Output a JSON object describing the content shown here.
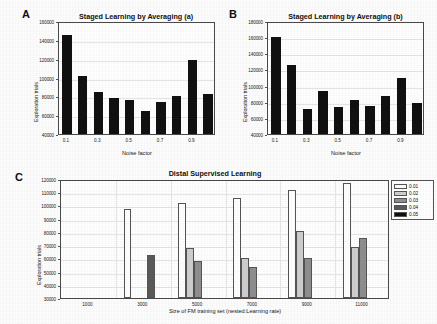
{
  "figure": {
    "background": "#fdfdfd",
    "bar_color_dark": "#111111"
  },
  "panels": [
    {
      "letter": "A",
      "title": "Staged Learning by Averaging (a)"
    },
    {
      "letter": "B",
      "title": "Staged Learning by Averaging (b)"
    },
    {
      "letter": "C",
      "title": "Distal Supervised Learning"
    }
  ],
  "chart_data": [
    {
      "type": "bar",
      "panel": "A",
      "title": "Staged Learning by Averaging (a)",
      "xlabel": "Noise factor",
      "ylabel": "Exploration trials",
      "ylim": [
        40000,
        160000
      ],
      "yticks": [
        40000,
        60000,
        80000,
        100000,
        120000,
        140000,
        160000
      ],
      "ytick_labels": [
        "40000",
        "60000",
        "80000",
        "100000",
        "120000",
        "140000",
        "160000"
      ],
      "categories": [
        "0.1",
        "0.2",
        "0.3",
        "0.4",
        "0.5",
        "0.6",
        "0.7",
        "0.8",
        "0.9",
        "1.0"
      ],
      "xtick_labels": [
        "0.1",
        "0.3",
        "0.5",
        "0.7",
        "0.9"
      ],
      "xtick_positions": [
        0,
        2,
        4,
        6,
        8
      ],
      "values": [
        145500,
        101500,
        84500,
        78500,
        76500,
        64800,
        74000,
        80800,
        118300,
        83000
      ],
      "grid": true,
      "legend": null
    },
    {
      "type": "bar",
      "panel": "B",
      "title": "Staged Learning by Averaging (b)",
      "xlabel": "Noise factor",
      "ylabel": "Exploration trials",
      "ylim": [
        40000,
        180000
      ],
      "yticks": [
        40000,
        60000,
        80000,
        100000,
        120000,
        140000,
        160000,
        180000
      ],
      "ytick_labels": [
        "40000",
        "60000",
        "80000",
        "100000",
        "120000",
        "140000",
        "160000",
        "180000"
      ],
      "categories": [
        "0.1",
        "0.2",
        "0.3",
        "0.4",
        "0.5",
        "0.6",
        "0.7",
        "0.8",
        "0.9",
        "1.0"
      ],
      "xtick_labels": [
        "0.1",
        "0.3",
        "0.5",
        "0.7",
        "0.9"
      ],
      "xtick_positions": [
        0,
        2,
        4,
        6,
        8
      ],
      "values": [
        160000,
        126000,
        70500,
        93500,
        73500,
        82200,
        74500,
        86500,
        110000,
        78500
      ],
      "grid": true,
      "legend": null
    },
    {
      "type": "bar",
      "panel": "C",
      "title": "Distal Supervised Learning",
      "xlabel": "Size of FM training set (nested:Learning rate)",
      "ylabel": "Exploration trials",
      "ylim": [
        30000,
        120000
      ],
      "yticks": [
        30000,
        40000,
        50000,
        60000,
        70000,
        80000,
        90000,
        100000,
        110000,
        120000
      ],
      "ytick_labels": [
        "30000",
        "40000",
        "50000",
        "60000",
        "70000",
        "80000",
        "90000",
        "100000",
        "110000",
        "120000"
      ],
      "categories": [
        "1000",
        "3000",
        "5000",
        "7000",
        "9000",
        "11000"
      ],
      "xtick_labels": [
        "1000",
        "3000",
        "5000",
        "7000",
        "9000",
        "11000"
      ],
      "series": [
        {
          "name": "0.01",
          "color": "#ffffff",
          "values": [
            null,
            97200,
            101900,
            105700,
            112000,
            116700
          ]
        },
        {
          "name": "0.02",
          "color": "#cfcfcf",
          "values": [
            null,
            null,
            68000,
            60000,
            80800,
            68300
          ]
        },
        {
          "name": "0.03",
          "color": "#8f8f8f",
          "values": [
            null,
            null,
            57800,
            53500,
            60600,
            75200
          ]
        },
        {
          "name": "0.04",
          "color": "#5a5a5a",
          "values": [
            null,
            62300,
            null,
            null,
            null,
            null
          ]
        },
        {
          "name": "0.05",
          "color": "#111111",
          "values": [
            null,
            null,
            null,
            null,
            null,
            null
          ]
        }
      ],
      "legend": {
        "position": "right",
        "entries": [
          "0.01",
          "0.02",
          "0.03",
          "0.04",
          "0.05"
        ],
        "colors": [
          "#ffffff",
          "#cfcfcf",
          "#8f8f8f",
          "#5a5a5a",
          "#111111"
        ]
      },
      "grid": true
    }
  ]
}
